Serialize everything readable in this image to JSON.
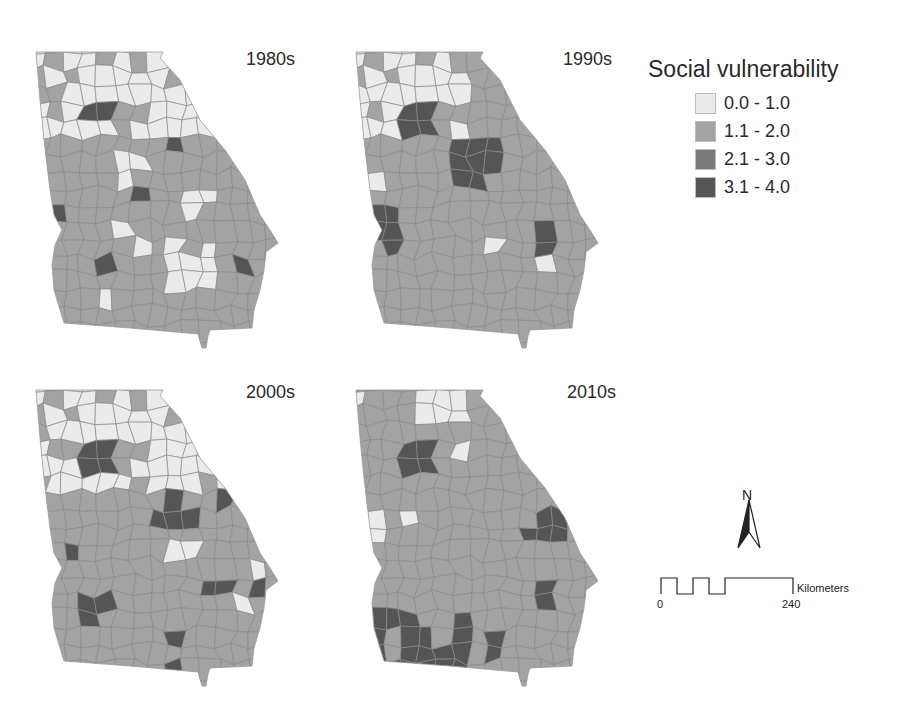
{
  "figure": {
    "legend": {
      "title": "Social vulnerability",
      "classes": [
        {
          "label": "0.0 - 1.0",
          "color": "#ebebeb"
        },
        {
          "label": "1.1 - 2.0",
          "color": "#a3a3a3"
        },
        {
          "label": "2.1 - 3.0",
          "color": "#7a7a7a"
        },
        {
          "label": "3.1 - 4.0",
          "color": "#555555"
        }
      ]
    },
    "maps": [
      {
        "label": "1980s"
      },
      {
        "label": "1990s"
      },
      {
        "label": "2000s"
      },
      {
        "label": "2010s"
      }
    ],
    "north_arrow": {
      "letter": "N"
    },
    "scale_bar": {
      "unit": "Kilometers",
      "start": "0",
      "end": "240"
    },
    "border_color": "#8a8a8a"
  }
}
